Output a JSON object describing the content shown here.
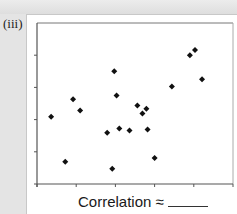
{
  "panel_label": "(iii)",
  "caption": {
    "text": "Correlation ≈",
    "blank": "______"
  },
  "colors": {
    "background": "#e4e4e4",
    "panel": "#ffffff",
    "axis": "#555555",
    "marker": "#111111"
  },
  "chart_data": {
    "type": "scatter",
    "title": "",
    "xlabel": "",
    "ylabel": "",
    "x_ticks_count": 6,
    "y_ticks_count": 6,
    "xlim": [
      0,
      5
    ],
    "ylim": [
      0,
      5
    ],
    "tick_labels_shown": false,
    "grid": false,
    "legend": null,
    "marker": "diamond",
    "annotation": "Correlation ≈ ______",
    "points": [
      {
        "x": 0.36,
        "y": 2.09
      },
      {
        "x": 0.72,
        "y": 0.69
      },
      {
        "x": 0.92,
        "y": 2.63
      },
      {
        "x": 1.1,
        "y": 2.28
      },
      {
        "x": 1.79,
        "y": 1.59
      },
      {
        "x": 1.92,
        "y": 0.47
      },
      {
        "x": 1.97,
        "y": 3.5
      },
      {
        "x": 2.03,
        "y": 2.75
      },
      {
        "x": 2.1,
        "y": 1.72
      },
      {
        "x": 2.36,
        "y": 1.66
      },
      {
        "x": 2.56,
        "y": 2.44
      },
      {
        "x": 2.69,
        "y": 2.19
      },
      {
        "x": 2.79,
        "y": 2.34
      },
      {
        "x": 2.82,
        "y": 1.69
      },
      {
        "x": 3.0,
        "y": 0.81
      },
      {
        "x": 3.44,
        "y": 3.03
      },
      {
        "x": 3.9,
        "y": 4.0
      },
      {
        "x": 4.03,
        "y": 4.16
      },
      {
        "x": 4.21,
        "y": 3.25
      }
    ]
  }
}
